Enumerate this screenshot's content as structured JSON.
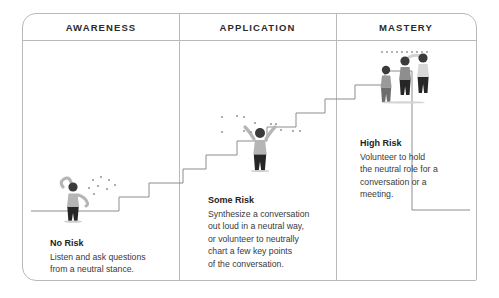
{
  "diagram": {
    "columns": [
      {
        "id": "awareness",
        "label": "AWARENESS"
      },
      {
        "id": "application",
        "label": "APPLICATION"
      },
      {
        "id": "mastery",
        "label": "MASTERY"
      }
    ],
    "steps": [
      {
        "id": "no-risk",
        "title": "No Risk",
        "lines": [
          "Listen and ask questions",
          "from a neutral stance."
        ]
      },
      {
        "id": "some-risk",
        "title": "Some Risk",
        "lines": [
          "Synthesize a conversation",
          "out loud in a neutral way,",
          "or volunteer to neutrally",
          "chart a few key points",
          "of the conversation."
        ]
      },
      {
        "id": "high-risk",
        "title": "High Risk",
        "lines": [
          "Volunteer to hold",
          "the neutral role for a",
          "conversation or a",
          "meeting."
        ]
      }
    ],
    "figures": [
      {
        "id": "figure-awareness",
        "pose": "one-arm-raised",
        "count": 1
      },
      {
        "id": "figure-application",
        "pose": "both-arms-raised",
        "count": 1
      },
      {
        "id": "figure-mastery",
        "pose": "group-pointing",
        "count": 3
      }
    ],
    "colors": {
      "frame_border": "#b9b9b9",
      "divider": "#b9b9b9",
      "stair_line": "#8d8d8d",
      "heading_text": "#2b2b2b",
      "body_text": "#3a3a3a",
      "figure_head_dark": "#3b3b3b",
      "figure_body_light": "#b5b5b5",
      "figure_legs_dark": "#262626",
      "dot_speckle": "#9a9a9a",
      "background": "#ffffff"
    }
  }
}
